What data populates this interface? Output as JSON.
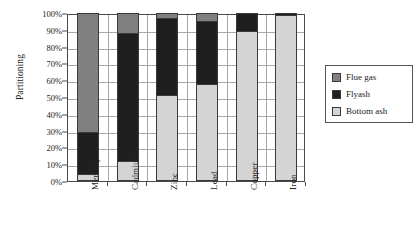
{
  "chart_data": {
    "type": "bar",
    "subtype": "stacked-100-percent",
    "title": "",
    "xlabel": "",
    "ylabel": "Partitioning",
    "categories": [
      "Mercury",
      "Cadmium",
      "Zinc",
      "Lead",
      "Copper",
      "Iron"
    ],
    "series": [
      {
        "name": "Bottom ash",
        "color": "#d4d4d4",
        "values": [
          4,
          12,
          51,
          58,
          89,
          99
        ]
      },
      {
        "name": "Flyash",
        "color": "#1f1f1f",
        "values": [
          25,
          76,
          46,
          37,
          11,
          1
        ]
      },
      {
        "name": "Flue gas",
        "color": "#808080",
        "values": [
          71,
          12,
          3,
          5,
          0,
          0
        ]
      }
    ],
    "cumulative_tops": {
      "Mercury": {
        "bottom_ash": 4,
        "flyash": 29,
        "flue_gas": 100
      },
      "Cadmium": {
        "bottom_ash": 12,
        "flyash": 88,
        "flue_gas": 100
      },
      "Zinc": {
        "bottom_ash": 51,
        "flyash": 97,
        "flue_gas": 100
      },
      "Lead": {
        "bottom_ash": 58,
        "flyash": 95,
        "flue_gas": 100
      },
      "Copper": {
        "bottom_ash": 89,
        "flyash": 100,
        "flue_gas": 100
      },
      "Iron": {
        "bottom_ash": 99,
        "flyash": 100,
        "flue_gas": 100
      }
    },
    "ylim": [
      0,
      100
    ],
    "ytick_values": [
      0,
      10,
      20,
      30,
      40,
      50,
      60,
      70,
      80,
      90,
      100
    ],
    "ytick_labels": [
      "0%",
      "10%",
      "20%",
      "30%",
      "40%",
      "50%",
      "60%",
      "70%",
      "80%",
      "90%",
      "100%"
    ],
    "grid": true,
    "legend_position": "right"
  },
  "legend": {
    "items": [
      {
        "label": "Flue gas",
        "color": "#808080"
      },
      {
        "label": "Flyash",
        "color": "#1f1f1f"
      },
      {
        "label": "Bottom ash",
        "color": "#d4d4d4"
      }
    ]
  },
  "colors": {
    "flue_gas": "#808080",
    "flyash": "#1f1f1f",
    "bottom_ash": "#d4d4d4",
    "axis": "#4a4a4a",
    "grid": "#a8a8a8",
    "background": "#ffffff"
  }
}
